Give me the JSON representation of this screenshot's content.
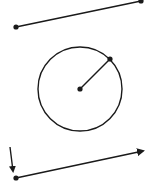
{
  "figure": {
    "width": 154,
    "height": 196,
    "stroke_color": "#1a1a1a",
    "background": "#ffffff",
    "segment": {
      "label": "line-segment",
      "start": {
        "x": 16,
        "y": 27
      },
      "end": {
        "x": 141,
        "y": 1
      }
    },
    "circle": {
      "label": "circle-with-radius",
      "center": {
        "x": 80,
        "y": 89
      },
      "radius": 42,
      "radius_end": {
        "x": 110,
        "y": 59
      }
    },
    "pointer_arrow": {
      "label": "pointer-arrow",
      "start": {
        "x": 10,
        "y": 147
      },
      "end": {
        "x": 13,
        "y": 171
      }
    },
    "vector": {
      "label": "vector-ray",
      "start": {
        "x": 16,
        "y": 178
      },
      "end": {
        "x": 143,
        "y": 151
      }
    }
  }
}
